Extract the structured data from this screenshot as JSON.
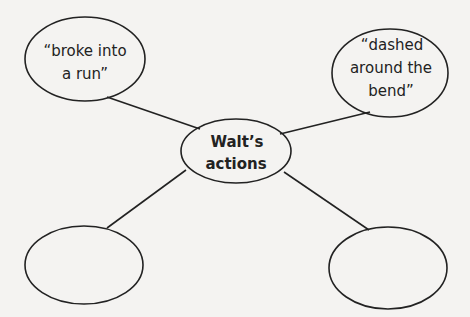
{
  "diagram": {
    "type": "concept-web",
    "center": {
      "lines": [
        "Walt’s",
        "actions"
      ]
    },
    "nodes": [
      {
        "position": "top-left",
        "lines": [
          "“broke into",
          "a run”"
        ]
      },
      {
        "position": "top-right",
        "lines": [
          "“dashed",
          "around the",
          "bend”"
        ]
      },
      {
        "position": "bottom-left",
        "lines": []
      },
      {
        "position": "bottom-right",
        "lines": []
      }
    ]
  }
}
